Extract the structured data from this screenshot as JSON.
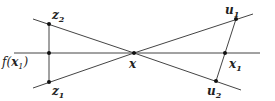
{
  "diagram": {
    "colors": {
      "line": "#444444",
      "point": "#111111",
      "background": "#ffffff"
    },
    "labels": {
      "z2": "z",
      "z2_sub": "2",
      "z1": "z",
      "z1_sub": "1",
      "f_prefix": "f(",
      "f_var": "x",
      "f_sub": "1",
      "f_suffix": ")",
      "x": "x",
      "u1": "u",
      "u1_sub": "1",
      "x1": "x",
      "x1_sub": "1",
      "u2": "u",
      "u2_sub": "2"
    },
    "points": [
      {
        "name": "z2",
        "x": 49,
        "y": 24
      },
      {
        "name": "f(x1)",
        "x": 49,
        "y": 53
      },
      {
        "name": "z1",
        "x": 49,
        "y": 82
      },
      {
        "name": "x",
        "x": 134,
        "y": 53
      },
      {
        "name": "u1",
        "x": 236,
        "y": 19
      },
      {
        "name": "x1",
        "x": 225,
        "y": 53
      },
      {
        "name": "u2",
        "x": 216,
        "y": 81
      }
    ]
  }
}
